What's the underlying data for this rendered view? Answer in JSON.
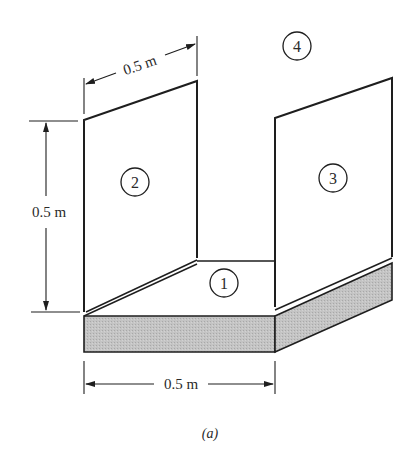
{
  "figure": {
    "caption": "(a)",
    "dimensions": {
      "top_width": "0.5 m",
      "left_height": "0.5 m",
      "bottom_width": "0.5 m"
    },
    "surfaces": [
      {
        "id": "1",
        "label": "1",
        "description": "floor surface"
      },
      {
        "id": "2",
        "label": "2",
        "description": "left vertical wall"
      },
      {
        "id": "3",
        "label": "3",
        "description": "right vertical wall"
      },
      {
        "id": "4",
        "label": "4",
        "description": "surroundings / open top"
      }
    ],
    "colors": {
      "line": "#1e1e1e",
      "slab_fill": "#bdbdbd",
      "background": "#ffffff"
    }
  }
}
